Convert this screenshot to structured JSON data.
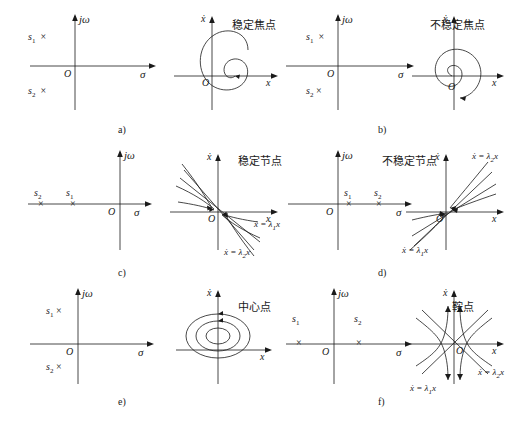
{
  "figure": {
    "type": "phase-portrait-classification",
    "axis_labels": {
      "complex_plane_vertical": "jω",
      "complex_plane_horizontal": "σ",
      "origin": "O",
      "phase_vertical": "ẋ",
      "phase_horizontal": "x"
    },
    "rows": [
      {
        "items": [
          {
            "caption": "a)",
            "name": "稳定焦点",
            "poles": [
              "s₁",
              "s₂"
            ],
            "pole_marks": "×",
            "pole_side": "left",
            "trajectory": "inward-spiral",
            "eigen_labels": []
          },
          {
            "caption": "b)",
            "name": "不稳定焦点",
            "poles": [
              "s₁",
              "s₂"
            ],
            "pole_marks": "×",
            "pole_side": "right",
            "trajectory": "outward-spiral",
            "eigen_labels": []
          }
        ]
      },
      {
        "items": [
          {
            "caption": "c)",
            "name": "稳定节点",
            "poles": [
              "s₂",
              "s₁"
            ],
            "pole_marks": "×",
            "pole_side": "left-real",
            "trajectory": "stable-node",
            "eigen_labels": [
              "ẋ = λ₁x",
              "ẋ = λ₂x"
            ]
          },
          {
            "caption": "d)",
            "name": "不稳定节点",
            "poles": [
              "s₁",
              "s₂"
            ],
            "pole_marks": "×",
            "pole_side": "right-real",
            "trajectory": "unstable-node",
            "eigen_labels": [
              "ẋ = λ₂x",
              "ẋ = λ₁x"
            ]
          }
        ]
      },
      {
        "items": [
          {
            "caption": "e)",
            "name": "中心点",
            "poles": [
              "s₁",
              "s₂"
            ],
            "pole_marks": "×",
            "pole_side": "imaginary",
            "trajectory": "center-ellipses",
            "eigen_labels": []
          },
          {
            "caption": "f)",
            "name": "鞍点",
            "poles": [
              "s₁",
              "s₂"
            ],
            "pole_marks": "×",
            "pole_side": "saddle-real",
            "trajectory": "saddle",
            "eigen_labels": [
              "ẋ = λ₂x",
              "ẋ = λ₁x"
            ]
          }
        ]
      }
    ]
  },
  "labels": {
    "jw": "jω",
    "sigma": "σ",
    "O": "O",
    "xdot": "ẋ",
    "x": "x",
    "s1": "s",
    "s2": "s",
    "one": "1",
    "two": "2",
    "cross": "×",
    "a": "a)",
    "b": "b)",
    "c": "c)",
    "d": "d)",
    "e": "e)",
    "f": "f)",
    "stable_focus": "稳定焦点",
    "unstable_focus": "不稳定焦点",
    "stable_node": "稳定节点",
    "unstable_node": "不稳定节点",
    "center": "中心点",
    "saddle": "鞍点",
    "lam1": "ẋ = λ",
    "lam2": "ẋ = λ",
    "eq_l1_sub": "1",
    "eq_l2_sub": "2",
    "eq_tail": "x"
  },
  "colors": {
    "stroke": "#1a1a1a",
    "background": "#ffffff"
  }
}
